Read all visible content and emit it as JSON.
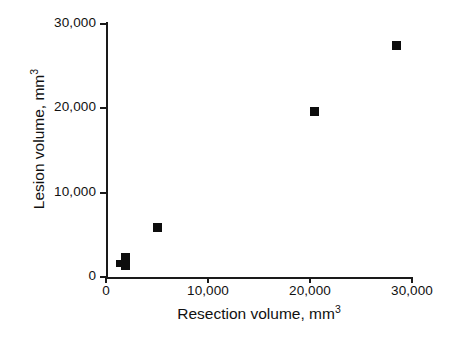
{
  "chart_data": {
    "type": "scatter",
    "title": "",
    "xlabel": "Resection volume, mm³",
    "ylabel": "Lesion volume, mm³",
    "xlabel_text": "Resection volume, mm",
    "xlabel_sup": "3",
    "ylabel_text": "Lesion volume, mm",
    "ylabel_sup": "3",
    "xlim": [
      0,
      30000
    ],
    "ylim": [
      0,
      30000
    ],
    "xticks": [
      0,
      10000,
      20000,
      30000
    ],
    "yticks": [
      0,
      10000,
      20000,
      30000
    ],
    "xticklabels": [
      "0",
      "10,000",
      "20,000",
      "30,000"
    ],
    "yticklabels": [
      "0",
      "10,000",
      "20,000",
      "30,000"
    ],
    "grid": false,
    "legend": null,
    "marker": "filled-square",
    "marker_color": "#0d0d0d",
    "axis_color": "#1a1a1a",
    "points": [
      {
        "x": 1300,
        "y": 1650,
        "size": "small"
      },
      {
        "x": 1900,
        "y": 2350,
        "size": "normal"
      },
      {
        "x": 1950,
        "y": 1400,
        "size": "normal"
      },
      {
        "x": 5000,
        "y": 5900,
        "size": "normal"
      },
      {
        "x": 20400,
        "y": 19600,
        "size": "normal"
      },
      {
        "x": 28500,
        "y": 27400,
        "size": "normal"
      }
    ]
  }
}
